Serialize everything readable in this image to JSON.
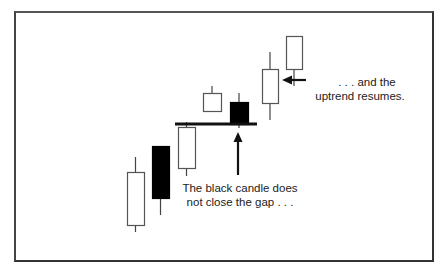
{
  "chart_data": {
    "type": "candlestick",
    "title": "",
    "xlabel": "",
    "ylabel": "",
    "grid": false,
    "legend": null,
    "candles": [
      {
        "index": 1,
        "color": "white",
        "body_top": 172,
        "body_bottom": 225,
        "wick_top": 157,
        "wick_bottom": 232,
        "x_left": 127,
        "x_right": 144
      },
      {
        "index": 2,
        "color": "black",
        "body_top": 146,
        "body_bottom": 198,
        "wick_top": 146,
        "wick_bottom": 215,
        "x_left": 152,
        "x_right": 169
      },
      {
        "index": 3,
        "color": "white",
        "body_top": 127,
        "body_bottom": 168,
        "wick_top": 122,
        "wick_bottom": 176,
        "x_left": 178,
        "x_right": 195
      },
      {
        "index": 4,
        "color": "white",
        "body_top": 93,
        "body_bottom": 111,
        "wick_top": 86,
        "wick_bottom": 111,
        "x_left": 203,
        "x_right": 221
      },
      {
        "index": 5,
        "color": "black",
        "body_top": 102,
        "body_bottom": 124,
        "wick_top": 93,
        "wick_bottom": 128,
        "x_left": 230,
        "x_right": 248
      },
      {
        "index": 6,
        "color": "white",
        "body_top": 69,
        "body_bottom": 103,
        "wick_top": 52,
        "wick_bottom": 120,
        "x_left": 262,
        "x_right": 278
      },
      {
        "index": 7,
        "color": "white",
        "body_top": 36,
        "body_bottom": 69,
        "wick_top": 36,
        "wick_bottom": 86,
        "x_left": 286,
        "x_right": 302
      }
    ],
    "gap_line": {
      "y": 124,
      "x_start": 175,
      "x_end": 257
    },
    "annotations": [
      {
        "text": "The black candle does not close the gap . . .",
        "arrow": "up",
        "target_candle": 5
      },
      {
        "text": ". . . and the uptrend resumes.",
        "arrow": "left",
        "target_candle": 6
      }
    ],
    "colors": {
      "frame": "#333333",
      "candle_outline": "#222222",
      "black_candle": "#000000",
      "white_candle": "#ffffff",
      "text": "#222222"
    }
  },
  "annotations": {
    "gap_note_line1": "The black candle does",
    "gap_note_line2": "not close the gap . . .",
    "trend_note_line1": ". . . and the",
    "trend_note_line2": "uptrend resumes."
  }
}
